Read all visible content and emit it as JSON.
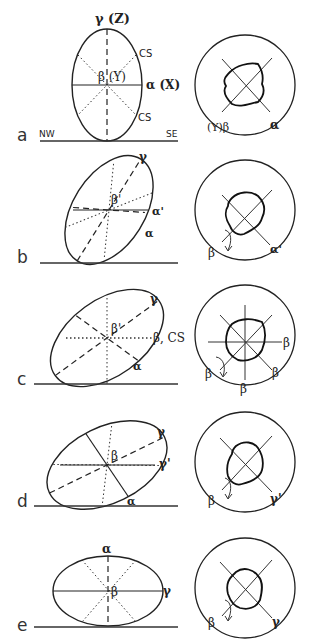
{
  "figure": {
    "panels": [
      {
        "letter": "a",
        "ellipse_labels": {
          "top": "γ (Z)",
          "center": "β (Y)",
          "right": "α (X)",
          "upper_right": "CS",
          "lower_right": "CS"
        },
        "baseline_labels": {
          "left": "NW",
          "right": "SE"
        },
        "circle_labels": {
          "lower_left": "(Y)β",
          "lower_right": "α"
        }
      },
      {
        "letter": "b",
        "ellipse_labels": {
          "top": "γ",
          "center": "β'",
          "right": "α'",
          "lower_right": "α"
        },
        "circle_labels": {
          "lower_left": "β",
          "lower_right": "α'"
        }
      },
      {
        "letter": "c",
        "ellipse_labels": {
          "top": "γ",
          "center": "β'",
          "right": "β, CS",
          "lower_right": "α"
        },
        "circle_labels": {
          "right": "β",
          "lower_right": "β",
          "bottom": "β",
          "lower_left": "β"
        }
      },
      {
        "letter": "d",
        "ellipse_labels": {
          "top": "γ",
          "center": "β",
          "right": "γ'",
          "bottom": "α"
        },
        "circle_labels": {
          "lower_left": "β",
          "lower_right": "γ'"
        }
      },
      {
        "letter": "e",
        "ellipse_labels": {
          "top": "α",
          "center": "β",
          "right": "γ"
        },
        "circle_labels": {
          "lower_left": "β",
          "lower_right": "γ"
        }
      }
    ]
  }
}
